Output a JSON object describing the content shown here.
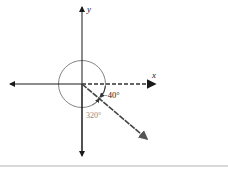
{
  "diagram": {
    "axes": {
      "x_label": "x",
      "y_label": "y"
    },
    "angles": {
      "negative_label": "−40°",
      "positive_label": "320°",
      "terminal_angle_deg": -40
    },
    "colors": {
      "axis": "#1a1a1a",
      "ray": "#3a3a3a",
      "circle": "#777777",
      "label_gray": "#888888",
      "footer_line": "#d8d8d8"
    }
  }
}
